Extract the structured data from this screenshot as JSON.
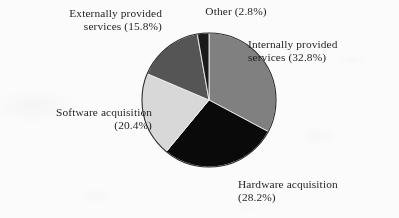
{
  "figure": {
    "background_color": "#fbfbfb",
    "text_color": "#1f1f1f"
  },
  "chart_data": {
    "type": "pie",
    "title": "",
    "subtitle": "",
    "xlabel": "",
    "ylabel": "",
    "legend_position": "none",
    "grid": false,
    "labels_inline": true,
    "start_angle_deg": 0,
    "direction": "clockwise",
    "center": {
      "x": 209,
      "y": 100,
      "radius": 67
    },
    "categories": [
      "Internally provided services",
      "Hardware acquisition",
      "Software acquisition",
      "Externally provided services",
      "Other"
    ],
    "values": [
      32.8,
      28.2,
      20.4,
      15.8,
      2.8
    ],
    "value_unit": "%",
    "slices": [
      {
        "name": "internally-provided-services",
        "label": "Internally provided\nservices (32.8%)",
        "category": "Internally provided services",
        "value": 32.8,
        "value_text": "32.8%",
        "color": "#808080",
        "start_deg": 0.0,
        "end_deg": 118.08
      },
      {
        "name": "hardware-acquisition",
        "label": "Hardware acquisition\n(28.2%)",
        "category": "Hardware acquisition",
        "value": 28.2,
        "value_text": "28.2%",
        "color": "#0a0a0a",
        "start_deg": 118.08,
        "end_deg": 219.6
      },
      {
        "name": "software-acquisition",
        "label": "Software acquisition\n(20.4%)",
        "category": "Software acquisition",
        "value": 20.4,
        "value_text": "20.4%",
        "color": "#d8d8d8",
        "start_deg": 219.6,
        "end_deg": 293.04
      },
      {
        "name": "externally-provided-services",
        "label": "Externally provided\nservices (15.8%)",
        "category": "Externally provided services",
        "value": 15.8,
        "value_text": "15.8%",
        "color": "#555555",
        "start_deg": 293.04,
        "end_deg": 349.92
      },
      {
        "name": "other",
        "label": "Other (2.8%)",
        "category": "Other",
        "value": 2.8,
        "value_text": "2.8%",
        "color": "#1a1a1a",
        "start_deg": 349.92,
        "end_deg": 360.0
      }
    ]
  }
}
